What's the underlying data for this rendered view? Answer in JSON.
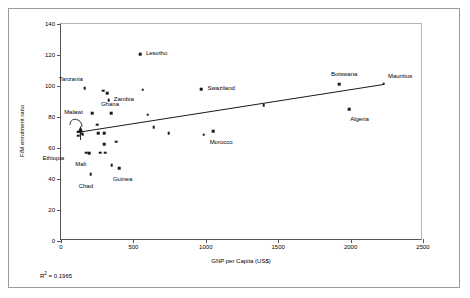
{
  "chart_data": {
    "type": "scatter",
    "title": "",
    "xlabel": "GNP per Capita (US$)",
    "ylabel": "F/M enrolment ratio",
    "xlim": [
      0,
      2500
    ],
    "ylim": [
      0,
      140
    ],
    "xticks": [
      0,
      500,
      1000,
      1500,
      2000,
      2500
    ],
    "yticks": [
      0,
      20,
      40,
      60,
      80,
      100,
      120,
      140
    ],
    "xtick_labels": [
      "0",
      "500",
      "1000",
      "1500",
      "2000",
      "2500"
    ],
    "ytick_labels": [
      "0",
      "20",
      "40",
      "60",
      "80",
      "100",
      "120",
      "140"
    ],
    "grid": false,
    "legend": false,
    "annotation_r_squared": "R",
    "annotation_r_squared_sup": "2",
    "annotation_r_squared_value": " = 0.1965",
    "trendline": {
      "type": "linear",
      "x_start": 110,
      "y_start": 70,
      "x_end": 2230,
      "y_end": 101
    },
    "points": [
      {
        "label": "",
        "x": 120,
        "y": 70.5
      },
      {
        "label": "",
        "x": 135,
        "y": 69.5
      },
      {
        "label": "",
        "x": 150,
        "y": 69.0
      },
      {
        "label": "Ethiopia",
        "x": 120,
        "y": 68.0,
        "label_dx": -36,
        "label_dy": 22
      },
      {
        "label": "",
        "x": 175,
        "y": 57.0
      },
      {
        "label": "Mali",
        "x": 195,
        "y": 56.5,
        "label_dx": -14,
        "label_dy": 11
      },
      {
        "label": "Chad",
        "x": 205,
        "y": 43.0,
        "label_dx": -12,
        "label_dy": 12
      },
      {
        "label": "Tanzania",
        "x": 165,
        "y": 98.5,
        "label_dx": -26,
        "label_dy": -9
      },
      {
        "label": "Malawi",
        "x": 215,
        "y": 82.5,
        "label_dx": -28,
        "label_dy": -1
      },
      {
        "label": "",
        "x": 250,
        "y": 75.0
      },
      {
        "label": "",
        "x": 255,
        "y": 69.5
      },
      {
        "label": "",
        "x": 270,
        "y": 57.0
      },
      {
        "label": "",
        "x": 290,
        "y": 97.0
      },
      {
        "label": "",
        "x": 300,
        "y": 69.5
      },
      {
        "label": "",
        "x": 300,
        "y": 62.5
      },
      {
        "label": "",
        "x": 305,
        "y": 57.0
      },
      {
        "label": "",
        "x": 320,
        "y": 95.5
      },
      {
        "label": "Zambia",
        "x": 330,
        "y": 91.0,
        "label_dx": 5,
        "label_dy": -1
      },
      {
        "label": "Ghana",
        "x": 345,
        "y": 82.5,
        "label_dx": -10,
        "label_dy": -9
      },
      {
        "label": "",
        "x": 350,
        "y": 49.0
      },
      {
        "label": "",
        "x": 380,
        "y": 64.0
      },
      {
        "label": "Guinea",
        "x": 400,
        "y": 47.0,
        "label_dx": -6,
        "label_dy": 11
      },
      {
        "label": "Lesotho",
        "x": 545,
        "y": 120.5,
        "label_dx": 6,
        "label_dy": -1
      },
      {
        "label": "",
        "x": 565,
        "y": 97.5
      },
      {
        "label": "",
        "x": 600,
        "y": 81.5
      },
      {
        "label": "",
        "x": 640,
        "y": 73.5
      },
      {
        "label": "",
        "x": 745,
        "y": 69.5
      },
      {
        "label": "Swaziland",
        "x": 970,
        "y": 98.0,
        "label_dx": 6,
        "label_dy": -1
      },
      {
        "label": "Morocco",
        "x": 985,
        "y": 68.5,
        "label_dx": 6,
        "label_dy": 7
      },
      {
        "label": "",
        "x": 1050,
        "y": 71.0
      },
      {
        "label": "",
        "x": 1400,
        "y": 87.5
      },
      {
        "label": "Botswana",
        "x": 1920,
        "y": 101.0,
        "label_dx": -8,
        "label_dy": -10
      },
      {
        "label": "Algeria",
        "x": 1990,
        "y": 85.0,
        "label_dx": 1,
        "label_dy": 10
      },
      {
        "label": "Mauritius",
        "x": 2230,
        "y": 101.5,
        "label_dx": 4,
        "label_dy": -8
      }
    ]
  }
}
